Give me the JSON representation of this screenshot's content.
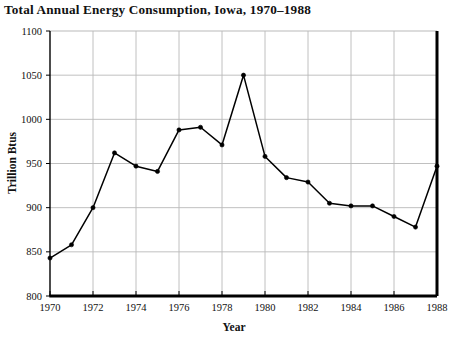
{
  "chart_data": {
    "type": "line",
    "title": "Total Annual Energy Consumption, Iowa, 1970–1988",
    "xlabel": "Year",
    "ylabel": "Trillion Btus",
    "xlim": [
      1970,
      1988
    ],
    "ylim": [
      800,
      1100
    ],
    "ytick_step": 50,
    "xtick_step": 2,
    "yticks": [
      800,
      850,
      900,
      950,
      1000,
      1050,
      1100
    ],
    "xticks": [
      1970,
      1972,
      1974,
      1976,
      1978,
      1980,
      1982,
      1984,
      1986,
      1988
    ],
    "grid": true,
    "legend": "none",
    "marker": "filled-circle",
    "line_color": "#000000",
    "grid_color": "#b9b9b9",
    "axis_color": "#000000",
    "x": [
      1970,
      1971,
      1972,
      1973,
      1974,
      1975,
      1976,
      1977,
      1978,
      1979,
      1980,
      1981,
      1982,
      1983,
      1984,
      1985,
      1986,
      1987,
      1988
    ],
    "values": [
      843,
      858,
      900,
      962,
      947,
      941,
      988,
      991,
      971,
      1050,
      958,
      934,
      929,
      905,
      902,
      902,
      890,
      878,
      947
    ],
    "series": [
      {
        "name": "Total Annual Energy Consumption",
        "values": [
          843,
          858,
          900,
          962,
          947,
          941,
          988,
          991,
          971,
          1050,
          958,
          934,
          929,
          905,
          902,
          902,
          890,
          878,
          947
        ]
      }
    ]
  },
  "title": {
    "text": "Total Annual Energy Consumption, Iowa, 1970–1988"
  },
  "axes": {
    "x_title": "Year",
    "y_title": "Trillion Btus"
  }
}
